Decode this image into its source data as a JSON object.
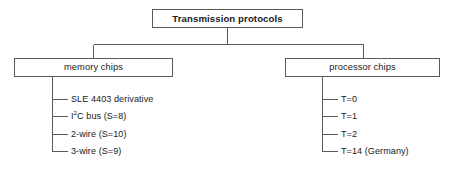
{
  "diagram": {
    "type": "tree",
    "title": "Transmission protocols",
    "root": {
      "label": "Transmission protocols",
      "bold": true
    },
    "branches": [
      {
        "id": "memory-chips",
        "label": "memory chips",
        "leaves": [
          {
            "id": "sle-4403-derivative",
            "text": "SLE 4403 derivative"
          },
          {
            "id": "i2c-bus",
            "text_prefix": "I",
            "superscript": "2",
            "text_suffix": "C bus (S=8)"
          },
          {
            "id": "2-wire",
            "text": "2-wire (S=10)"
          },
          {
            "id": "3-wire",
            "text": "3-wire (S=9)"
          }
        ]
      },
      {
        "id": "processor-chips",
        "label": "processor chips",
        "leaves": [
          {
            "id": "t-0",
            "text": "T=0"
          },
          {
            "id": "t-1",
            "text": "T=1"
          },
          {
            "id": "t-2",
            "text": "T=2"
          },
          {
            "id": "t-14-germany",
            "text": "T=14 (Germany)"
          }
        ]
      }
    ],
    "colors": {
      "line": "#5a5a5a",
      "text": "#1a1a1a",
      "background": "#ffffff"
    }
  }
}
